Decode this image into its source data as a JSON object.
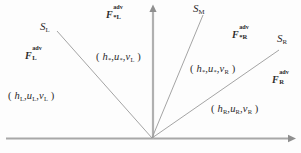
{
  "diagram": {
    "name": "hllc-riemann-wave-fan",
    "background_color": "#fdfdfd",
    "line_color": "#8c8c8c",
    "text_color": "#2b2b2b"
  },
  "axes": {
    "origin": {
      "x": 152,
      "y": 138
    },
    "vertical": {
      "name": "t-axis",
      "x": 153,
      "top_y": 6,
      "bottom_y": 139
    },
    "horizontal": {
      "name": "x-axis",
      "y": 138,
      "left_x": 6,
      "right_x": 293
    }
  },
  "waves": [
    {
      "id": "S_L",
      "label_text": "S",
      "label_sub": "L",
      "from": {
        "x": 57,
        "y": 31
      },
      "to": {
        "x": 152,
        "y": 138
      }
    },
    {
      "id": "S_M",
      "label_text": "S",
      "label_sub": "M",
      "from": {
        "x": 203,
        "y": 15
      },
      "to": {
        "x": 152,
        "y": 138
      }
    },
    {
      "id": "S_R",
      "label_text": "S",
      "label_sub": "R",
      "from": {
        "x": 279,
        "y": 50
      },
      "to": {
        "x": 152,
        "y": 138
      }
    }
  ],
  "labels": {
    "wave_SL": {
      "base": "S",
      "sub": "L"
    },
    "wave_SM": {
      "base": "S",
      "sub": "M"
    },
    "wave_SR": {
      "base": "S",
      "sub": "R"
    },
    "flux_L": {
      "base": "F",
      "sup": "adv",
      "sub": "L"
    },
    "flux_star_L": {
      "base": "F",
      "sup": "adv",
      "sub": "*L"
    },
    "flux_star_R": {
      "base": "F",
      "sup": "adv",
      "sub": "*R"
    },
    "flux_R": {
      "base": "F",
      "sup": "adv",
      "sub": "R"
    },
    "state_L": {
      "open": "( ",
      "h": "h",
      "h_sub": "L",
      "c1": ",",
      "u": "u",
      "u_sub": "L",
      "c2": ",",
      "v": "v",
      "v_sub": "L",
      "close": " )"
    },
    "state_star_L": {
      "open": "( ",
      "h": "h",
      "h_sub": "*",
      "c1": ",",
      "u": "u",
      "u_sub": "*",
      "c2": ",",
      "v": "v",
      "v_sub": "L",
      "close": " )"
    },
    "state_star_R": {
      "open": "( ",
      "h": "h",
      "h_sub": "*",
      "c1": ",",
      "u": "u",
      "u_sub": "*",
      "c2": ",",
      "v": "v",
      "v_sub": "R",
      "close": " )"
    },
    "state_R": {
      "open": "( ",
      "h": "h",
      "h_sub": "R",
      "c1": ",",
      "u": "u",
      "u_sub": "R",
      "c2": ",",
      "v": "v",
      "v_sub": "R",
      "close": " )"
    }
  }
}
